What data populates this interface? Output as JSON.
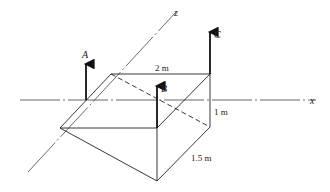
{
  "figure": {
    "axes": {
      "x_label": "x",
      "z_label": "z"
    },
    "forces": [
      {
        "id": "A",
        "label": "A"
      },
      {
        "id": "B",
        "label": "B"
      },
      {
        "id": "C",
        "label": "C"
      }
    ],
    "dimensions": {
      "width": "2 m",
      "height": "1 m",
      "depth": "1.5 m"
    },
    "colors": {
      "line": "#222222",
      "axis": "#444444"
    }
  }
}
